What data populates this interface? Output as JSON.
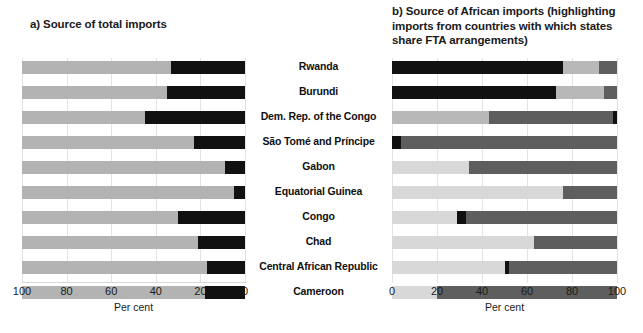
{
  "panel_a": {
    "title": "a) Source of total imports",
    "axis_label": "Per cent",
    "ticks": [
      "100",
      "80",
      "60",
      "40",
      "20",
      "0"
    ]
  },
  "panel_b": {
    "title": "b) Source of African imports (highlighting imports from countries with which states share FTA arrangements)",
    "axis_label": "Per cent",
    "ticks": [
      "0",
      "20",
      "40",
      "60",
      "80",
      "100"
    ]
  },
  "countries": [
    "Rwanda",
    "Burundi",
    "Dem. Rep. of the Congo",
    "São Tomé and Príncipe",
    "Gabon",
    "Equatorial Guinea",
    "Congo",
    "Chad",
    "Central African Republic",
    "Cameroon"
  ],
  "colors": {
    "light_gray": "#b3b3b3",
    "black": "#111111",
    "b_light_gray": "#d8d8d8",
    "b_mid_gray": "#b8b8b8",
    "b_dark_gray": "#5e5e5e",
    "b_black": "#111111",
    "gridline": "#e3e3e3"
  },
  "chart_data": [
    {
      "type": "bar",
      "orientation": "horizontal-stacked",
      "title": "a) Source of total imports",
      "xlabel": "Per cent",
      "ylabel": "",
      "xlim": [
        100,
        0
      ],
      "x_reversed": true,
      "grid": true,
      "tick_values": [
        100,
        80,
        60,
        40,
        20,
        0
      ],
      "categories": [
        "Rwanda",
        "Burundi",
        "Dem. Rep. of the Congo",
        "São Tomé and Príncipe",
        "Gabon",
        "Equatorial Guinea",
        "Congo",
        "Chad",
        "Central African Republic",
        "Cameroon"
      ],
      "series": [
        {
          "name": "Rest of world",
          "color": "#b3b3b3",
          "values": [
            67,
            65,
            55,
            77,
            91,
            95,
            70,
            79,
            83,
            82
          ]
        },
        {
          "name": "Africa",
          "color": "#111111",
          "values": [
            33,
            35,
            45,
            23,
            9,
            5,
            30,
            21,
            17,
            18
          ]
        }
      ]
    },
    {
      "type": "bar",
      "orientation": "horizontal-stacked",
      "title": "b) Source of African imports (highlighting imports from countries with which states share FTA arrangements)",
      "xlabel": "Per cent",
      "ylabel": "",
      "xlim": [
        0,
        100
      ],
      "x_reversed": false,
      "grid": true,
      "tick_values": [
        0,
        20,
        40,
        60,
        80,
        100
      ],
      "categories": [
        "Rwanda",
        "Burundi",
        "Dem. Rep. of the Congo",
        "São Tomé and Príncipe",
        "Gabon",
        "Equatorial Guinea",
        "Congo",
        "Chad",
        "Central African Republic",
        "Cameroon"
      ],
      "stacks": [
        [
          {
            "name": "FTA partners",
            "color": "#111111",
            "value": 76
          },
          {
            "name": "Other African - light",
            "color": "#b8b8b8",
            "value": 16
          },
          {
            "name": "Other African - dark",
            "color": "#5e5e5e",
            "value": 8
          }
        ],
        [
          {
            "name": "FTA partners",
            "color": "#111111",
            "value": 73
          },
          {
            "name": "Other African - light",
            "color": "#b8b8b8",
            "value": 21
          },
          {
            "name": "Other African - dark",
            "color": "#5e5e5e",
            "value": 6
          }
        ],
        [
          {
            "name": "Other African - light",
            "color": "#b8b8b8",
            "value": 43
          },
          {
            "name": "Other African - dark",
            "color": "#5e5e5e",
            "value": 55
          },
          {
            "name": "FTA partners",
            "color": "#111111",
            "value": 2
          }
        ],
        [
          {
            "name": "FTA partners",
            "color": "#111111",
            "value": 4
          },
          {
            "name": "Other African - dark",
            "color": "#5e5e5e",
            "value": 96
          }
        ],
        [
          {
            "name": "Other African - light",
            "color": "#d8d8d8",
            "value": 34
          },
          {
            "name": "Other African - dark",
            "color": "#5e5e5e",
            "value": 66
          }
        ],
        [
          {
            "name": "Other African - light",
            "color": "#d8d8d8",
            "value": 76
          },
          {
            "name": "Other African - dark",
            "color": "#5e5e5e",
            "value": 24
          }
        ],
        [
          {
            "name": "Other African - light",
            "color": "#d8d8d8",
            "value": 29
          },
          {
            "name": "FTA partners",
            "color": "#111111",
            "value": 4
          },
          {
            "name": "Other African - dark",
            "color": "#5e5e5e",
            "value": 67
          }
        ],
        [
          {
            "name": "Other African - light",
            "color": "#d8d8d8",
            "value": 63
          },
          {
            "name": "Other African - dark",
            "color": "#5e5e5e",
            "value": 37
          }
        ],
        [
          {
            "name": "Other African - light",
            "color": "#d8d8d8",
            "value": 50
          },
          {
            "name": "FTA partners",
            "color": "#111111",
            "value": 2
          },
          {
            "name": "Other African - dark",
            "color": "#5e5e5e",
            "value": 48
          }
        ],
        [
          {
            "name": "Other African - light",
            "color": "#d8d8d8",
            "value": 20
          },
          {
            "name": "Other African - dark",
            "color": "#5e5e5e",
            "value": 80
          }
        ]
      ]
    }
  ]
}
